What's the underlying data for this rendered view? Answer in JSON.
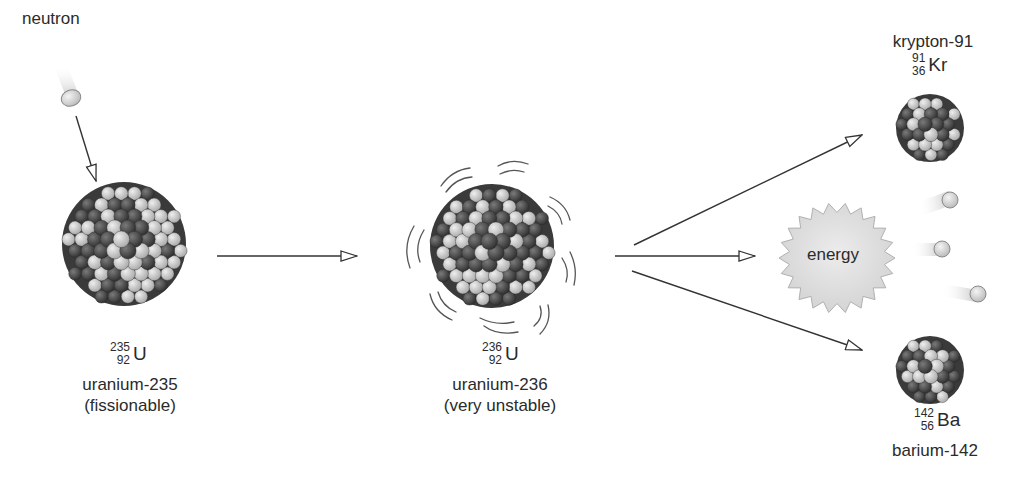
{
  "diagram": {
    "type": "nuclear-fission",
    "colors": {
      "background": "#ffffff",
      "proton": "#c8c8c8",
      "neutron_particle": "#4a4a4a",
      "arrow": "#333333",
      "energy_fill": "#dcdcdc",
      "text": "#2b2b2b"
    },
    "incoming": {
      "label": "neutron"
    },
    "stage1": {
      "isotope": {
        "mass": "235",
        "atomic": "92",
        "symbol": "U"
      },
      "name": "uranium-235",
      "note": "(fissionable)"
    },
    "stage2": {
      "isotope": {
        "mass": "236",
        "atomic": "92",
        "symbol": "U"
      },
      "name": "uranium-236",
      "note": "(very unstable)"
    },
    "products": {
      "krypton": {
        "name": "krypton-91",
        "isotope": {
          "mass": "91",
          "atomic": "36",
          "symbol": "Kr"
        }
      },
      "energy": {
        "label": "energy"
      },
      "neutrons_released": 3,
      "barium": {
        "isotope": {
          "mass": "142",
          "atomic": "56",
          "symbol": "Ba"
        },
        "name": "barium-142"
      }
    }
  }
}
